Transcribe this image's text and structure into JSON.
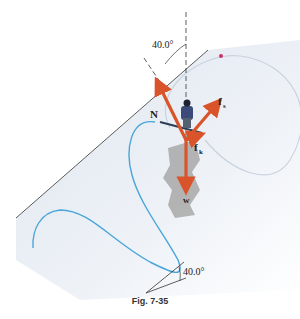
{
  "top_text": "...to the slope ... ...ked ... ...per...",
  "figure": {
    "caption": "Fig. 7-35",
    "top_angle_label": "40.0°",
    "bottom_angle_label": "40.0°",
    "vectors": [
      {
        "name": "N",
        "label": "N",
        "description": "normal force, perpendicular to slope, pointing up-left"
      },
      {
        "name": "fs",
        "label": "f",
        "subscript": "s",
        "description": "static friction, along slope up-right"
      },
      {
        "name": "fk",
        "label": "f",
        "subscript": "k",
        "description": "kinetic friction, short vector along slope"
      },
      {
        "name": "w",
        "label": "w",
        "description": "weight, pointing straight down"
      }
    ],
    "colors": {
      "vector": "#d9542a",
      "slope_fill": "#e6ecf4",
      "ski_track": "#4aa6d8",
      "faint_track": "#c9d3dd",
      "shadow": "#a8a8a8",
      "line": "#333333",
      "marker": "#d0306a"
    }
  }
}
